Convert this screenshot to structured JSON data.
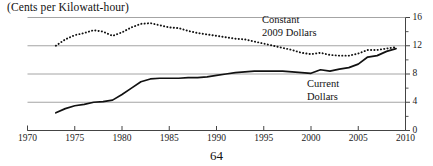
{
  "figure": {
    "title": "(Cents per Kilowatt-hour)",
    "page_number": "64"
  },
  "labels": {
    "constant_line1": "Constant",
    "constant_line2": "2009 Dollars",
    "current_line1": "Current",
    "current_line2": "Dollars"
  },
  "colors": {
    "ink": "#111111",
    "gridline": "#9a9a9a",
    "axis": "#444444",
    "background": "#ffffff"
  },
  "chart_data": {
    "type": "line",
    "title": "(Cents per Kilowatt-hour)",
    "xlabel": "",
    "ylabel": "Cents per Kilowatt-hour",
    "xlim": [
      1970,
      2010
    ],
    "ylim": [
      0,
      16
    ],
    "xticks": [
      1970,
      1975,
      1980,
      1985,
      1990,
      1995,
      2000,
      2005,
      2010
    ],
    "xtick_labels": [
      "1970",
      "1975",
      "1980",
      "1985",
      "1990",
      "1995",
      "2000",
      "2005",
      "2010"
    ],
    "yticks": [
      0,
      4,
      8,
      12,
      16
    ],
    "ytick_labels": [
      "0",
      "4",
      "8",
      "12",
      "16"
    ],
    "yminorticks": [
      2,
      6,
      10,
      14
    ],
    "grid": "horizontal",
    "legend": "inline-annotations",
    "series": [
      {
        "name": "Constant 2009 Dollars",
        "style": "dotted",
        "x": [
          1973,
          1974,
          1975,
          1976,
          1977,
          1978,
          1979,
          1980,
          1981,
          1982,
          1983,
          1984,
          1985,
          1986,
          1987,
          1988,
          1989,
          1990,
          1991,
          1992,
          1993,
          1994,
          1995,
          1996,
          1997,
          1998,
          1999,
          2000,
          2001,
          2002,
          2003,
          2004,
          2005,
          2006,
          2007,
          2008,
          2009
        ],
        "values": [
          12.0,
          12.9,
          13.5,
          13.8,
          14.2,
          14.0,
          13.4,
          13.9,
          14.6,
          15.1,
          15.2,
          14.9,
          14.6,
          14.5,
          14.1,
          13.8,
          13.6,
          13.4,
          13.2,
          13.0,
          12.9,
          12.6,
          12.3,
          12.0,
          11.7,
          11.4,
          11.0,
          10.8,
          11.0,
          10.7,
          10.6,
          10.6,
          10.9,
          11.4,
          11.4,
          11.6,
          11.8
        ]
      },
      {
        "name": "Current Dollars",
        "style": "solid",
        "x": [
          1973,
          1974,
          1975,
          1976,
          1977,
          1978,
          1979,
          1980,
          1981,
          1982,
          1983,
          1984,
          1985,
          1986,
          1987,
          1988,
          1989,
          1990,
          1991,
          1992,
          1993,
          1994,
          1995,
          1996,
          1997,
          1998,
          1999,
          2000,
          2001,
          2002,
          2003,
          2004,
          2005,
          2006,
          2007,
          2008,
          2009
        ],
        "values": [
          2.5,
          3.1,
          3.5,
          3.7,
          4.0,
          4.1,
          4.3,
          5.1,
          6.0,
          6.9,
          7.3,
          7.4,
          7.4,
          7.4,
          7.5,
          7.5,
          7.6,
          7.8,
          8.0,
          8.2,
          8.3,
          8.4,
          8.4,
          8.4,
          8.4,
          8.3,
          8.2,
          8.1,
          8.6,
          8.4,
          8.7,
          8.9,
          9.4,
          10.4,
          10.6,
          11.2,
          11.6
        ]
      }
    ]
  }
}
